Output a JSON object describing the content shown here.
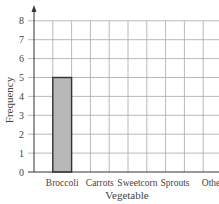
{
  "chart_data": {
    "type": "bar",
    "title": "",
    "xlabel": "Vegetable",
    "ylabel": "Frequency",
    "categories": [
      "Broccoli",
      "Carrots",
      "Sweetcorn",
      "Sprouts",
      "Other"
    ],
    "values": [
      5,
      null,
      null,
      null,
      null
    ],
    "ylim": [
      0,
      8
    ],
    "yticks": [
      0,
      1,
      2,
      3,
      4,
      5,
      6,
      7,
      8
    ],
    "grid": true,
    "legend": null,
    "bar_color": "#b8b8b8",
    "bar_edge_color": "#333333",
    "grid_color": "#a8a8a8"
  },
  "labels": {
    "xlabel": "Vegetable",
    "ylabel": "Frequency",
    "categories": [
      "Broccoli",
      "Carrots",
      "Sweetcorn",
      "Sprouts",
      "Other"
    ],
    "yticks": [
      "0",
      "1",
      "2",
      "3",
      "4",
      "5",
      "6",
      "7",
      "8"
    ]
  }
}
